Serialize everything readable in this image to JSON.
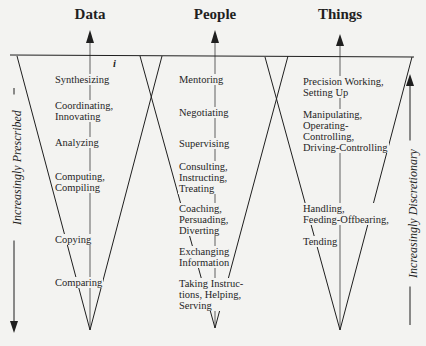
{
  "columns": [
    {
      "title": "Data",
      "functions": [
        "Synthesizing",
        "Coordinating,\nInnovating",
        "Analyzing",
        "Computing,\nCompiling",
        "Copying",
        "Comparing"
      ]
    },
    {
      "title": "People",
      "functions": [
        "Mentoring",
        "Negotiating",
        "Supervising",
        "Consulting,\nInstructing,\nTreating",
        "Coaching,\nPersuading,\nDiverting",
        "Exchanging\nInformation",
        "Taking Instruc-\ntions, Helping,\nServing"
      ]
    },
    {
      "title": "Things",
      "functions": [
        "Precision Working,\nSetting Up",
        "Manipulating,\nOperating-\nControlling,\nDriving-Controlling",
        "Handling,\nFeeding-Offbearing,",
        "Tending"
      ]
    }
  ],
  "axes": {
    "left_label": "Increasingly Prescribed",
    "right_label": "Increasingly Discretionary"
  },
  "annotation_mark": "i",
  "colors": {
    "ink": "#1f1f1f",
    "paper": "#f3f3f1"
  }
}
